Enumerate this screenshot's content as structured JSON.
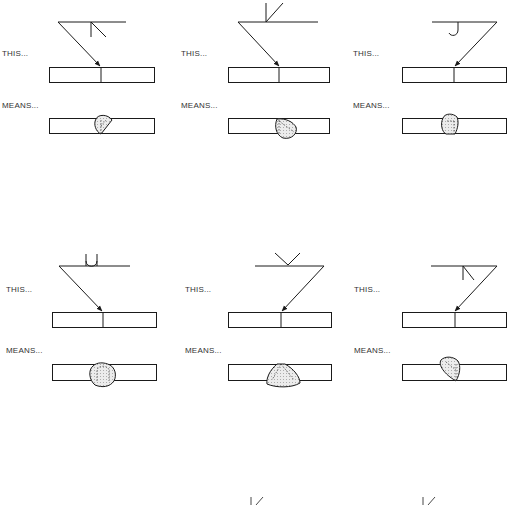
{
  "colors": {
    "line": "#1a1a1a",
    "weld_fill": "#e4e4e4",
    "background": "#ffffff"
  },
  "panels": [
    {
      "id": "fillet-arrow-side",
      "symbol": "fillet",
      "this_label": "THIS...",
      "means_label": "MEANS...",
      "arrow_direction": "right"
    },
    {
      "id": "bevel-other-side",
      "symbol": "bevel-groove",
      "this_label": "THIS...",
      "means_label": "MEANS...",
      "arrow_direction": "right"
    },
    {
      "id": "j-groove-arrow-side",
      "symbol": "j-groove",
      "this_label": "THIS...",
      "means_label": "MEANS...",
      "arrow_direction": "left"
    },
    {
      "id": "u-groove-other-side",
      "symbol": "u-groove",
      "this_label": "THIS...",
      "means_label": "MEANS...",
      "arrow_direction": "right"
    },
    {
      "id": "v-groove-other-side",
      "symbol": "v-groove",
      "this_label": "THIS...",
      "means_label": "MEANS...",
      "arrow_direction": "left"
    },
    {
      "id": "bevel-arrow-side",
      "symbol": "bevel-groove",
      "this_label": "THIS...",
      "means_label": "MEANS...",
      "arrow_direction": "left"
    }
  ]
}
